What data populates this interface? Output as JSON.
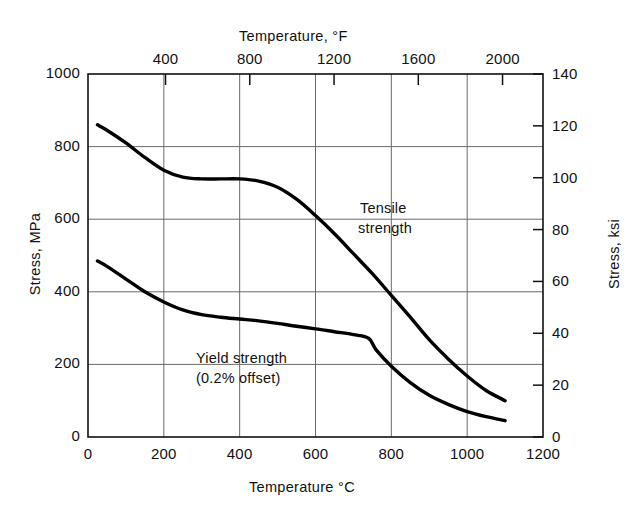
{
  "chart_data": {
    "type": "line",
    "title": "",
    "xlabel": "Temperature °C",
    "xlabel_top": "Temperature, °F",
    "ylabel": "Stress, MPa",
    "ylabel_right": "Stress, ksi",
    "xlim": [
      0,
      1200
    ],
    "ylim": [
      0,
      1000
    ],
    "ylim_right": [
      0,
      140
    ],
    "xlim_top": [
      32,
      2192
    ],
    "grid": true,
    "legend": "inline-annotations",
    "x_ticks": [
      "0",
      "200",
      "400",
      "600",
      "800",
      "1000",
      "1200"
    ],
    "x_ticks_top": [
      "400",
      "800",
      "1200",
      "1600",
      "2000"
    ],
    "y_ticks": [
      "0",
      "200",
      "400",
      "600",
      "800",
      "1000"
    ],
    "y_ticks_right": [
      "0",
      "20",
      "40",
      "60",
      "80",
      "100",
      "120",
      "140"
    ],
    "series": [
      {
        "name": "Tensile strength",
        "label_lines": [
          "Tensile",
          "strength"
        ],
        "x": [
          25,
          50,
          100,
          150,
          200,
          250,
          300,
          350,
          400,
          450,
          500,
          550,
          600,
          650,
          700,
          750,
          800,
          850,
          900,
          950,
          1000,
          1050,
          1100
        ],
        "y": [
          860,
          845,
          810,
          770,
          735,
          716,
          711,
          711,
          711,
          705,
          688,
          655,
          610,
          560,
          505,
          450,
          390,
          330,
          268,
          215,
          168,
          128,
          100
        ]
      },
      {
        "name": "Yield strength (0.2% offset)",
        "label_lines": [
          "Yield strength",
          "(0.2% offset)"
        ],
        "x": [
          25,
          50,
          100,
          150,
          200,
          250,
          300,
          350,
          400,
          450,
          500,
          550,
          600,
          650,
          700,
          740,
          760,
          800,
          850,
          900,
          950,
          1000,
          1050,
          1100
        ],
        "y": [
          485,
          470,
          435,
          400,
          372,
          350,
          337,
          330,
          325,
          320,
          313,
          305,
          298,
          290,
          282,
          272,
          240,
          195,
          150,
          115,
          90,
          70,
          56,
          45
        ]
      }
    ]
  },
  "axes": {
    "bottom_title": "Temperature °C",
    "top_title": "Temperature, °F",
    "left_title": "Stress, MPa",
    "right_title": "Stress, ksi"
  },
  "colors": {
    "curve": "#000000",
    "grid": "#6a6a6a",
    "frame": "#111111",
    "background": "#ffffff"
  }
}
